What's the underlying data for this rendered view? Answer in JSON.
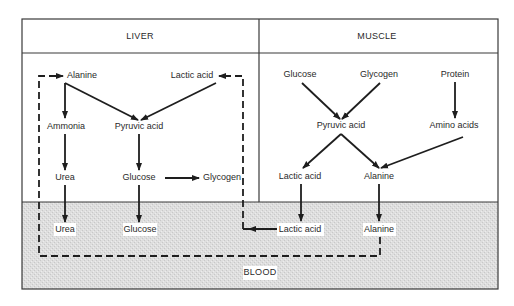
{
  "sections": {
    "liver": "LIVER",
    "muscle": "MUSCLE",
    "blood": "BLOOD"
  },
  "liver": {
    "alanine": "Alanine",
    "lactic_acid": "Lactic acid",
    "ammonia": "Ammonia",
    "pyruvic_acid": "Pyruvic acid",
    "urea": "Urea",
    "glucose": "Glucose",
    "glycogen": "Glycogen"
  },
  "muscle": {
    "glucose": "Glucose",
    "glycogen": "Glycogen",
    "protein": "Protein",
    "pyruvic_acid": "Pyruvic acid",
    "amino_acids": "Amino acids",
    "lactic_acid": "Lactic acid",
    "alanine": "Alanine"
  },
  "blood": {
    "urea": "Urea",
    "glucose": "Glucose",
    "lactic_acid": "Lactic acid",
    "alanine": "Alanine"
  },
  "colors": {
    "line": "#1e1e1e",
    "blood_fill": "#d9d9d9",
    "background": "#ffffff"
  },
  "edges": [
    {
      "from": "liver.alanine",
      "to": "liver.ammonia",
      "style": "solid"
    },
    {
      "from": "liver.alanine",
      "to": "liver.pyruvic_acid",
      "style": "solid"
    },
    {
      "from": "liver.lactic_acid",
      "to": "liver.pyruvic_acid",
      "style": "solid"
    },
    {
      "from": "liver.ammonia",
      "to": "liver.urea",
      "style": "solid"
    },
    {
      "from": "liver.pyruvic_acid",
      "to": "liver.glucose",
      "style": "solid"
    },
    {
      "from": "liver.glucose",
      "to": "liver.glycogen",
      "style": "solid"
    },
    {
      "from": "liver.urea",
      "to": "blood.urea",
      "style": "solid"
    },
    {
      "from": "liver.glucose",
      "to": "blood.glucose",
      "style": "solid"
    },
    {
      "from": "muscle.glucose",
      "to": "muscle.pyruvic_acid",
      "style": "solid"
    },
    {
      "from": "muscle.glycogen",
      "to": "muscle.pyruvic_acid",
      "style": "solid"
    },
    {
      "from": "muscle.protein",
      "to": "muscle.amino_acids",
      "style": "solid"
    },
    {
      "from": "muscle.pyruvic_acid",
      "to": "muscle.lactic_acid",
      "style": "solid"
    },
    {
      "from": "muscle.pyruvic_acid",
      "to": "muscle.alanine",
      "style": "solid"
    },
    {
      "from": "muscle.amino_acids",
      "to": "muscle.alanine",
      "style": "solid"
    },
    {
      "from": "muscle.lactic_acid",
      "to": "blood.lactic_acid",
      "style": "solid"
    },
    {
      "from": "muscle.alanine",
      "to": "blood.alanine",
      "style": "solid"
    },
    {
      "from": "blood.lactic_acid",
      "to": "liver.lactic_acid",
      "style": "dashed"
    },
    {
      "from": "blood.alanine",
      "to": "liver.alanine",
      "style": "dashed"
    }
  ]
}
